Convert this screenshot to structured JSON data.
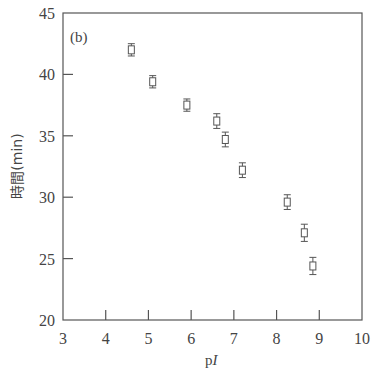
{
  "chart_data": {
    "type": "scatter",
    "title": "",
    "panel_label": "(b)",
    "xlabel": "pI",
    "xlabel_prefix": "p",
    "xlabel_italic": "I",
    "ylabel": "時間(min)",
    "xlim": [
      3,
      10
    ],
    "ylim": [
      20,
      45
    ],
    "xticks": [
      3,
      4,
      5,
      6,
      7,
      8,
      9,
      10
    ],
    "yticks": [
      20,
      25,
      30,
      35,
      40,
      45
    ],
    "grid": false,
    "marker": "open-square",
    "error_bars": true,
    "series": [
      {
        "name": "data",
        "points": [
          {
            "x": 4.6,
            "y": 42.0,
            "err": 0.5
          },
          {
            "x": 5.1,
            "y": 39.4,
            "err": 0.5
          },
          {
            "x": 5.9,
            "y": 37.5,
            "err": 0.5
          },
          {
            "x": 6.6,
            "y": 36.2,
            "err": 0.6
          },
          {
            "x": 6.8,
            "y": 34.7,
            "err": 0.6
          },
          {
            "x": 7.2,
            "y": 32.2,
            "err": 0.6
          },
          {
            "x": 8.25,
            "y": 29.6,
            "err": 0.6
          },
          {
            "x": 8.65,
            "y": 27.1,
            "err": 0.7
          },
          {
            "x": 8.85,
            "y": 24.4,
            "err": 0.7
          }
        ]
      }
    ]
  }
}
